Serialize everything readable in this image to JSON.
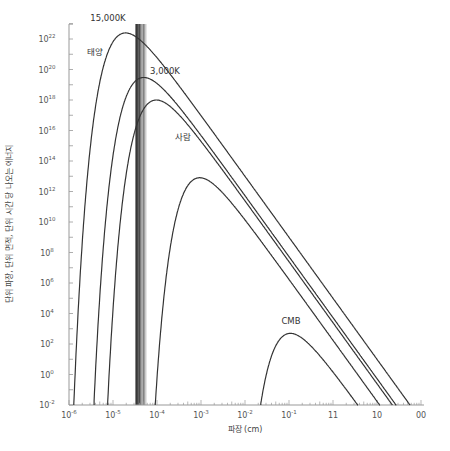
{
  "chart_data": {
    "type": "line",
    "title": "",
    "xlabel": "파장 (cm)",
    "ylabel": "단위 파장, 단위 면적, 단위 시간 당 나오는 에너지",
    "x_scale": "log",
    "y_scale": "log",
    "xlim_log10": [
      -6,
      2
    ],
    "ylim_log10": [
      -2,
      23.5
    ],
    "x_ticks": [
      {
        "base": "10",
        "exp": "-6"
      },
      {
        "base": "10",
        "exp": "-5"
      },
      {
        "base": "10",
        "exp": "-4"
      },
      {
        "base": "10",
        "exp": "-3"
      },
      {
        "base": "10",
        "exp": "-2"
      },
      {
        "base": "10",
        "exp": "-1"
      },
      {
        "base": "11",
        "exp": ""
      },
      {
        "base": "10",
        "exp": ""
      },
      {
        "base": "00",
        "exp": ""
      }
    ],
    "y_ticks": [
      {
        "base": "10",
        "exp": "22"
      },
      {
        "base": "10",
        "exp": "20"
      },
      {
        "base": "10",
        "exp": "18"
      },
      {
        "base": "10",
        "exp": "16"
      },
      {
        "base": "10",
        "exp": "14"
      },
      {
        "base": "10",
        "exp": "12"
      },
      {
        "base": "10",
        "exp": "10"
      },
      {
        "base": "10",
        "exp": "8"
      },
      {
        "base": "10",
        "exp": "6"
      },
      {
        "base": "10",
        "exp": "4"
      },
      {
        "base": "10",
        "exp": "2"
      },
      {
        "base": "10",
        "exp": "0"
      },
      {
        "base": "10",
        "exp": "-2"
      }
    ],
    "grid": false,
    "legend": "inline labels",
    "series": [
      {
        "name": "15,000K",
        "temperature_K": 15000,
        "peak_wavelength_cm": 1.9e-05,
        "peak_value": 2.5e+22
      },
      {
        "name": "태양",
        "temperature_K": 5800,
        "peak_wavelength_cm": 5e-05,
        "peak_value": 3e+19
      },
      {
        "name": "3,000K",
        "temperature_K": 3000,
        "peak_wavelength_cm": 9.7e-05,
        "peak_value": 1e+18
      },
      {
        "name": "사람",
        "temperature_K": 310,
        "peak_wavelength_cm": 0.00093,
        "peak_value": 8000000000000.0
      },
      {
        "name": "CMB",
        "temperature_K": 2.7,
        "peak_wavelength_cm": 0.107,
        "peak_value": 500.0
      }
    ],
    "annotations": [
      {
        "type": "vertical_band",
        "description": "visible light spectrum band",
        "x_from_cm": 4e-05,
        "x_to_cm": 7e-05
      }
    ]
  }
}
